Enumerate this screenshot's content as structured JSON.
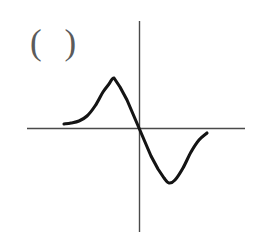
{
  "figure": {
    "label": "( )",
    "background_color": "#ffffff",
    "width": 255,
    "height": 239,
    "axis_color": "#4a4a4a",
    "curve_color": "#141414",
    "label_color": "#5b5b5b"
  },
  "chart_data": {
    "type": "line",
    "title": "( )",
    "xlabel": "",
    "ylabel": "",
    "grid": false,
    "legend": null,
    "axes": {
      "origin_px": [
        139,
        128
      ],
      "x_axis_px": {
        "x1": 27,
        "y1": 128,
        "x2": 245,
        "y2": 128
      },
      "y_axis_px": {
        "x1": 139,
        "y1": 21,
        "x2": 139,
        "y2": 232
      },
      "xlim": [
        -112,
        106
      ],
      "ylim": [
        -104,
        107
      ],
      "xticks": [],
      "yticks": []
    },
    "series": [
      {
        "name": "curve",
        "x": [
          -75,
          -68,
          -60,
          -52,
          -44,
          -36,
          -30,
          -25,
          -19,
          -12,
          -6,
          0,
          6,
          12,
          19,
          25,
          30,
          36,
          44,
          52,
          60,
          68
        ],
        "y": [
          4,
          5,
          7,
          12,
          22,
          36,
          44,
          50,
          41,
          28,
          14,
          0,
          -14,
          -28,
          -41,
          -50,
          -55,
          -52,
          -40,
          -24,
          -12,
          -5
        ],
        "points_px": [
          [
            64,
            124
          ],
          [
            71,
            123
          ],
          [
            79,
            121
          ],
          [
            87,
            116
          ],
          [
            95,
            106
          ],
          [
            103,
            92
          ],
          [
            109,
            84
          ],
          [
            114,
            78
          ],
          [
            120,
            87
          ],
          [
            127,
            100
          ],
          [
            133,
            114
          ],
          [
            139,
            128
          ],
          [
            145,
            142
          ],
          [
            151,
            156
          ],
          [
            158,
            169
          ],
          [
            164,
            178
          ],
          [
            169,
            183
          ],
          [
            175,
            180
          ],
          [
            183,
            168
          ],
          [
            191,
            152
          ],
          [
            199,
            140
          ],
          [
            207,
            133
          ]
        ],
        "key_features": {
          "left_tail_start_px": [
            64,
            124
          ],
          "peak_px": [
            114,
            78
          ],
          "origin_crossing_px": [
            139,
            128
          ],
          "trough_px": [
            165,
            186
          ],
          "right_tail_end_px": [
            207,
            133
          ]
        }
      }
    ]
  }
}
